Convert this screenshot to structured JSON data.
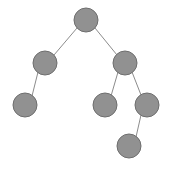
{
  "figure": {
    "kind": "binary-tree-diagram",
    "width": 170,
    "height": 175,
    "background_color": "#ffffff",
    "node_fill_color": "#919191",
    "node_stroke_color": "#6e6e6e",
    "edge_color": "#8c8c8c",
    "node_radius": 12,
    "edge_stroke_width": 1,
    "node_count": 7,
    "edge_count": 6,
    "depth": 4
  },
  "nodes": [
    {
      "id": "root",
      "role": "root",
      "label": "",
      "cx": 86,
      "cy": 20,
      "r": 12
    },
    {
      "id": "left",
      "role": "left-child",
      "label": "",
      "cx": 45,
      "cy": 63,
      "r": 12
    },
    {
      "id": "right",
      "role": "right-child",
      "label": "",
      "cx": 125,
      "cy": 63,
      "r": 12
    },
    {
      "id": "left-left",
      "role": "leaf",
      "label": "",
      "cx": 25,
      "cy": 105,
      "r": 12
    },
    {
      "id": "right-left",
      "role": "leaf",
      "label": "",
      "cx": 105,
      "cy": 105,
      "r": 12
    },
    {
      "id": "right-right",
      "role": "internal",
      "label": "",
      "cx": 147,
      "cy": 105,
      "r": 12
    },
    {
      "id": "right-right-right",
      "role": "leaf",
      "label": "",
      "cx": 129,
      "cy": 146,
      "r": 12
    }
  ],
  "edges": [
    {
      "id": "edge-root-left",
      "from": "root",
      "to": "left",
      "x1": 77,
      "y1": 28,
      "x2": 54,
      "y2": 55
    },
    {
      "id": "edge-root-right",
      "from": "root",
      "to": "right",
      "x1": 95,
      "y1": 28,
      "x2": 117,
      "y2": 55
    },
    {
      "id": "edge-left-leftleft",
      "from": "left",
      "to": "left-left",
      "x1": 38,
      "y1": 72,
      "x2": 32,
      "y2": 96
    },
    {
      "id": "edge-right-rightleft",
      "from": "right",
      "to": "right-left",
      "x1": 118,
      "y1": 72,
      "x2": 111,
      "y2": 96
    },
    {
      "id": "edge-right-rightright",
      "from": "right",
      "to": "right-right",
      "x1": 132,
      "y1": 72,
      "x2": 141,
      "y2": 95
    },
    {
      "id": "edge-rr-rrr",
      "from": "right-right",
      "to": "right-right-right",
      "x1": 141,
      "y1": 115,
      "x2": 136,
      "y2": 137
    }
  ]
}
